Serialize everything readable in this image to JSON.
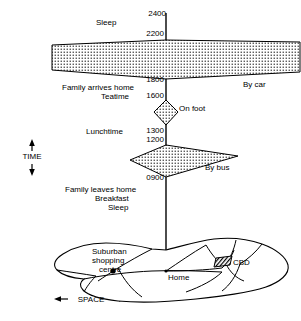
{
  "diagram": {
    "axes": {
      "time_label": "TIME",
      "space_label": "SPACE"
    },
    "vertical_axis": {
      "name": "time-axis"
    },
    "time_marks": [
      {
        "value": "2400",
        "y": 13
      },
      {
        "value": "2200",
        "y": 33
      },
      {
        "value": "1800",
        "y": 80
      },
      {
        "value": "1600",
        "y": 96
      },
      {
        "value": "1300",
        "y": 131
      },
      {
        "value": "1200",
        "y": 140
      },
      {
        "value": "0900",
        "y": 178
      }
    ],
    "activity_labels": [
      {
        "text": "Sleep",
        "x": 96,
        "y": 22
      },
      {
        "text": "Family arrives home",
        "x": 62,
        "y": 87
      },
      {
        "text": "Teatime",
        "x": 101,
        "y": 96
      },
      {
        "text": "Lunchtime",
        "x": 89,
        "y": 131
      },
      {
        "text": "Family leaves home",
        "x": 65,
        "y": 189
      },
      {
        "text": "Breakfast",
        "x": 97,
        "y": 198
      },
      {
        "text": "Sleep",
        "x": 111,
        "y": 207
      }
    ],
    "mode_labels": [
      {
        "text": "By car",
        "x": 243,
        "y": 84,
        "name": "mode-by-car"
      },
      {
        "text": "On foot",
        "x": 179,
        "y": 108,
        "name": "mode-on-foot"
      },
      {
        "text": "By bus",
        "x": 205,
        "y": 167,
        "name": "mode-by-bus"
      }
    ],
    "map_labels": [
      {
        "text": "Suburban",
        "x": 92,
        "y": 251
      },
      {
        "text": "shopping",
        "x": 92,
        "y": 260
      },
      {
        "text": "centre",
        "x": 99,
        "y": 269
      },
      {
        "text": "Home",
        "x": 168,
        "y": 277
      },
      {
        "text": "CBD",
        "x": 233,
        "y": 262
      }
    ],
    "prisms": [
      {
        "name": "evening-car-prism",
        "mode": "By car",
        "fill": "stipple"
      },
      {
        "name": "midday-foot-prism",
        "mode": "On foot",
        "fill": "stipple"
      },
      {
        "name": "morning-bus-prism",
        "mode": "By bus",
        "fill": "stipple"
      }
    ],
    "colors": {
      "ink": "#000000",
      "paper": "#ffffff",
      "stipple": "#2b2b2b"
    }
  }
}
